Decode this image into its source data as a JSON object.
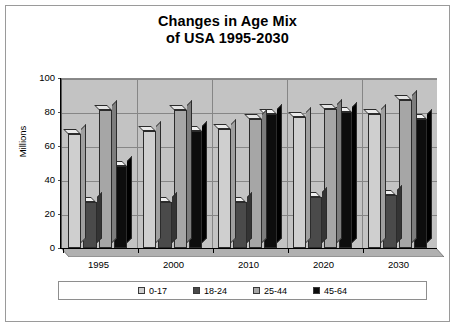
{
  "chart_data": {
    "type": "bar",
    "title": "Changes in Age Mix of USA 1995-2030",
    "title_lines": [
      "Changes in Age Mix",
      "of USA 1995-2030"
    ],
    "xlabel": "",
    "ylabel": "Millions",
    "ylim": [
      0,
      100
    ],
    "ytick_values": [
      0,
      20,
      40,
      60,
      80,
      100
    ],
    "ytick_labels": [
      "0",
      "20",
      "40",
      "60",
      "80",
      "100"
    ],
    "categories": [
      "1995",
      "2000",
      "2010",
      "2020",
      "2030"
    ],
    "grid": true,
    "legend_position": "bottom",
    "style": "3d-clustered-column",
    "series": [
      {
        "name": "0-17",
        "color": "#cfcfcf",
        "values": [
          67,
          69,
          70,
          77,
          79
        ]
      },
      {
        "name": "18-24",
        "color": "#4a4a4a",
        "values": [
          27,
          27,
          27,
          30,
          31
        ]
      },
      {
        "name": "25-44",
        "color": "#a6a6a6",
        "values": [
          81,
          81,
          76,
          82,
          87
        ]
      },
      {
        "name": "45-64",
        "color": "#0d0d0d",
        "values": [
          48,
          69,
          79,
          80,
          76
        ]
      }
    ]
  },
  "legend": {
    "items": [
      {
        "label": "0-17"
      },
      {
        "label": "18-24"
      },
      {
        "label": "25-44"
      },
      {
        "label": "45-64"
      }
    ]
  }
}
